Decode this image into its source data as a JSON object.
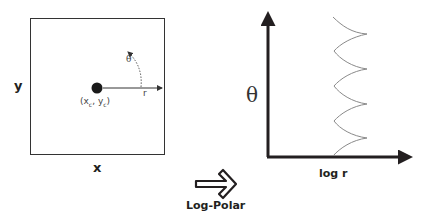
{
  "cartesian": {
    "x_label": "x",
    "y_label": "y",
    "center_label": "(x",
    "center_sub_c1": "c",
    "center_mid": ", y",
    "center_sub_c2": "c",
    "center_close": ")",
    "radius_label": "r",
    "angle_label": "θ"
  },
  "transform": {
    "label": "Log-Polar",
    "arrow_icon": "double-arrow-right-icon"
  },
  "log_polar": {
    "y_label": "θ",
    "x_label": "log r"
  },
  "colors": {
    "axis": "#231f20",
    "box": "#333333",
    "curve": "#8a8a8a",
    "dot": "#1a1a1a"
  }
}
